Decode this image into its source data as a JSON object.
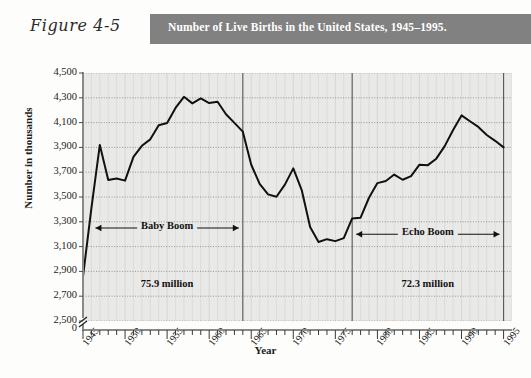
{
  "figure": {
    "label": "Figure 4-5",
    "title": "Number of Live Births in the United States, 1945–1995.",
    "band_color": "#818181"
  },
  "chart_data": {
    "type": "line",
    "title": "Number of Live Births in the United States, 1945–1995.",
    "xlabel": "Year",
    "ylabel": "Number in thousands",
    "xlim": [
      1945,
      1996
    ],
    "ylim": [
      2500,
      4500
    ],
    "ytick_labels": [
      "4,500",
      "4,300",
      "4,100",
      "3,900",
      "3,700",
      "3,500",
      "3,300",
      "3,100",
      "2,900",
      "2,700",
      "2,500",
      "0"
    ],
    "ytick_values": [
      4500,
      4300,
      4100,
      3900,
      3700,
      3500,
      3300,
      3100,
      2900,
      2700,
      2500
    ],
    "axis_break": true,
    "xtick_labels": [
      "1945",
      "1950",
      "1955",
      "1960",
      "1965",
      "1970",
      "1975",
      "1980",
      "1985",
      "1990",
      "1995"
    ],
    "xtick_values": [
      1945,
      1950,
      1955,
      1960,
      1965,
      1970,
      1975,
      1980,
      1985,
      1990,
      1995
    ],
    "minor_xticks_every": 1,
    "grid": true,
    "legend": false,
    "line_color": "#111111",
    "plot_background": "#e9e9e7",
    "x": [
      1945,
      1946,
      1947,
      1948,
      1949,
      1950,
      1951,
      1952,
      1953,
      1954,
      1955,
      1956,
      1957,
      1958,
      1959,
      1960,
      1961,
      1962,
      1963,
      1964,
      1965,
      1966,
      1967,
      1968,
      1969,
      1970,
      1971,
      1972,
      1973,
      1974,
      1975,
      1976,
      1977,
      1978,
      1979,
      1980,
      1981,
      1982,
      1983,
      1984,
      1985,
      1986,
      1987,
      1988,
      1989,
      1990,
      1991,
      1992,
      1993,
      1994,
      1995
    ],
    "values": [
      2858,
      3411,
      3920,
      3637,
      3649,
      3632,
      3823,
      3913,
      3965,
      4078,
      4097,
      4218,
      4308,
      4255,
      4295,
      4258,
      4268,
      4167,
      4098,
      4027,
      3760,
      3606,
      3521,
      3502,
      3600,
      3731,
      3556,
      3258,
      3137,
      3160,
      3144,
      3168,
      3327,
      3333,
      3494,
      3612,
      3629,
      3681,
      3639,
      3669,
      3761,
      3757,
      3809,
      3910,
      4041,
      4158,
      4111,
      4065,
      4000,
      3953,
      3900
    ],
    "annotations": [
      {
        "name": "baby-boom",
        "text": "Baby Boom",
        "arrows": "both",
        "x_start": 1946,
        "x_end": 1964,
        "y": 3250
      },
      {
        "name": "baby-boom-total",
        "text": "75.9 million",
        "x_center": 1955,
        "y": 2780
      },
      {
        "name": "echo-boom",
        "text": "Echo Boom",
        "arrows": "both",
        "x_start": 1977,
        "x_end": 1995,
        "y": 3200
      },
      {
        "name": "echo-boom-total",
        "text": "72.3 million",
        "x_center": 1986,
        "y": 2780
      }
    ],
    "vertical_markers": [
      1964,
      1977,
      1995
    ]
  }
}
